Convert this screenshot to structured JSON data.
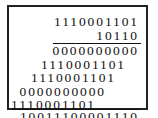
{
  "multiplication": {
    "multiplicand": "1110001101",
    "multiplier": "10110",
    "partial_products": [
      "0000000000",
      "1110001101",
      "1110001101",
      "0000000000",
      "1110001101"
    ],
    "result": "10011100001110"
  }
}
